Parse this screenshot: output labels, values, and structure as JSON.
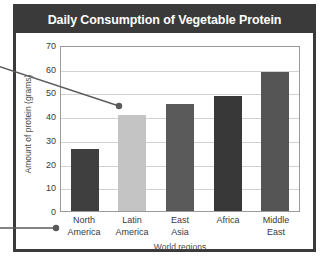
{
  "chart_data": {
    "type": "bar",
    "title": "Daily Consumption of Vegetable Protein",
    "xlabel": "World regions",
    "ylabel": "Amount of protein (grams)",
    "categories": [
      "North America",
      "Latin America",
      "East Asia",
      "Africa",
      "Middle East"
    ],
    "category_lines": [
      [
        "North",
        "America"
      ],
      [
        "Latin",
        "America"
      ],
      [
        "East",
        "Asia"
      ],
      [
        "Africa",
        ""
      ],
      [
        "Middle",
        "East"
      ]
    ],
    "values": [
      26.5,
      41,
      45.5,
      49,
      59.5
    ],
    "bar_colors": [
      "#3f3f3f",
      "#c4c4c4",
      "#5a5a5a",
      "#383838",
      "#555555"
    ],
    "ylim": [
      0,
      70
    ],
    "yticks": [
      0,
      10,
      20,
      30,
      40,
      50,
      60,
      70
    ],
    "ytick_labels": [
      "0",
      "10",
      "20",
      "30",
      "40",
      "50",
      "60",
      "70"
    ],
    "grid": true,
    "legend": "none"
  },
  "figure": {
    "title_bar_color": "#3a3a3a",
    "title_text_color": "#ffffff",
    "border_color": "#3a3a3a",
    "plot_border_color": "#9a9a9a",
    "gridline_color": "#d2d2d2"
  },
  "annotations": {
    "color": "#5a5a5a",
    "callout_upper": {
      "name": "data-point-callout",
      "target_category": "Latin America",
      "target_value": 41
    },
    "callout_lower": {
      "name": "axis-label-callout",
      "target_category": "North America"
    }
  }
}
